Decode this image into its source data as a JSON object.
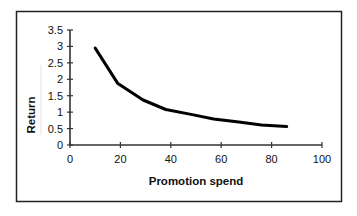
{
  "chart_data": {
    "type": "line",
    "title": "",
    "xlabel": "Promotion spend",
    "ylabel": "Return",
    "xlim": [
      0,
      100
    ],
    "ylim": [
      0,
      3.5
    ],
    "x_ticks": [
      0,
      20,
      40,
      60,
      80,
      100
    ],
    "y_ticks": [
      0,
      0.5,
      1,
      1.5,
      2,
      2.5,
      3,
      3.5
    ],
    "x_tick_labels": [
      "0",
      "20",
      "40",
      "60",
      "80",
      "100"
    ],
    "y_tick_labels": [
      "0",
      "0.5",
      "1",
      "1.5",
      "2",
      "2.5",
      "3",
      "3.5"
    ],
    "grid": false,
    "legend": null,
    "series": [
      {
        "name": "Return",
        "color": "#000000",
        "x": [
          10,
          19,
          29,
          38,
          48,
          57,
          67,
          76,
          86
        ],
        "values": [
          2.95,
          1.87,
          1.37,
          1.08,
          0.93,
          0.79,
          0.7,
          0.61,
          0.56
        ]
      }
    ]
  },
  "colors": {
    "line": "#000000",
    "frame": "#222222",
    "background": "#ffffff"
  }
}
